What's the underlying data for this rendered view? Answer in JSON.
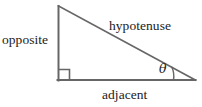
{
  "figure": {
    "kind": "right-triangle-trigonometry-diagram",
    "background_color": "#ffffff",
    "stroke_color": "#666666",
    "text_color": "#1b1b1b",
    "labels": {
      "opposite": "opposite",
      "hypotenuse": "hypotenuse",
      "adjacent": "adjacent",
      "angle": "θ"
    },
    "marks": {
      "right_angle": "right-angle-square",
      "angle_arc": "angle-arc"
    },
    "geometry": {
      "apex": [
        58,
        6
      ],
      "right_angle_vertex": [
        58,
        80
      ],
      "theta_vertex": [
        195,
        80
      ],
      "right_angle_box_size": 11
    }
  }
}
